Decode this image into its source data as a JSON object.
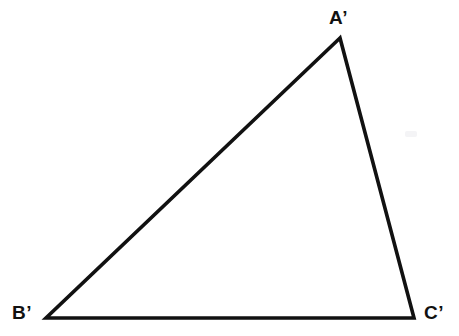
{
  "figure": {
    "background_color": "#ffffff",
    "stroke_color": "#111111",
    "stroke_width": 3.6,
    "width": 459,
    "height": 336,
    "shape": "triangle"
  },
  "chart_data": {
    "type": "diagram",
    "subtype": "geometric-figure",
    "title": "",
    "xlabel": "",
    "ylabel": "",
    "shape": "triangle",
    "stroke_color": "#111111",
    "fill_color": "none",
    "vertices": [
      {
        "label": "A’",
        "x": 340,
        "y": 38
      },
      {
        "label": "B’",
        "x": 46,
        "y": 318
      },
      {
        "label": "C’",
        "x": 414,
        "y": 318
      }
    ],
    "edges": [
      {
        "from": "B’",
        "to": "A’"
      },
      {
        "from": "A’",
        "to": "C’"
      },
      {
        "from": "C’",
        "to": "B’"
      }
    ],
    "annotations": []
  },
  "labels": {
    "a_prime": "A’",
    "b_prime": "B’",
    "c_prime": "C’"
  }
}
